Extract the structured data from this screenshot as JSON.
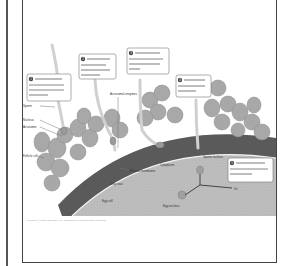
{
  "figure": {
    "type": "fertilization-diagram",
    "colors": {
      "jelly_coat": "#5a5a5a",
      "cytoplasm": "#bdbdbd",
      "cells": "#a8a8a8",
      "plasma_membrane": "#f2f2f2",
      "callout_border": "#777777",
      "frame": "#444444"
    },
    "callouts": [
      {
        "number": "1",
        "text": "The sperm squeezes through cells left over from the follicle."
      },
      {
        "number": "2",
        "text": "The sperm's acrosomal enzymes digest the jelly coat."
      },
      {
        "number": "3",
        "text": "The plasma membranes of the sperm and egg fuse."
      },
      {
        "number": "4",
        "text": "The sperm enters the egg cytoplasm."
      },
      {
        "number": "5",
        "text": "The sperm and egg chromosomes intermingle."
      }
    ],
    "labels": {
      "sperm": "Sperm",
      "nucleus": "Nucleus",
      "acrosome": "Acrosome",
      "follicle_cell": "Follicle cell",
      "acrosomal_enzymes": "Acrosomal enzymes",
      "plasma_membrane": "Plasma membrane",
      "jelly_coat": "Jelly coat",
      "cytoplasm": "Cytoplasm",
      "egg_cell": "Egg cell",
      "sperm_nucleus": "Sperm nucleus",
      "egg_nucleus": "Egg nucleus",
      "zygote": "2n"
    },
    "credit": "Copyright © Pearson Education, Inc., publishing as Pearson Benjamin Cummings."
  }
}
